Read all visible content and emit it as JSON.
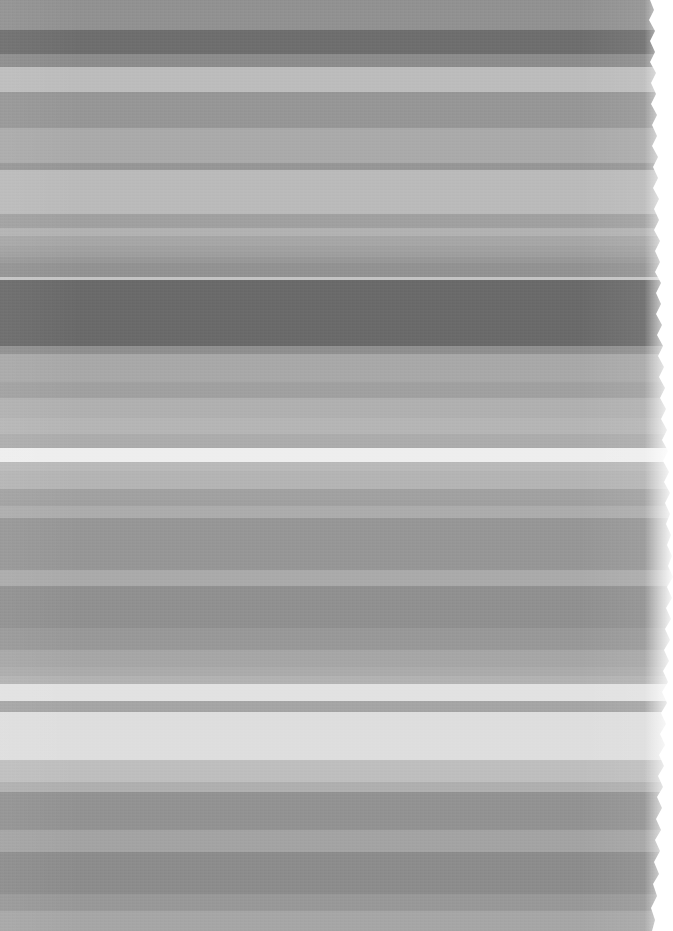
{
  "image": {
    "kind": "abstract-horizontal-band-scan",
    "title": "Horizontal grayscale band field",
    "width": 673,
    "height": 931,
    "background_color": "#ffffff",
    "description": "Low-resolution scan-like image composed of stacked horizontal grayscale bands with a ragged torn right edge exposing white paper."
  },
  "chart_data": {
    "type": "heatmap",
    "xlabel": "",
    "ylabel": "",
    "orientation": "horizontal-bands",
    "x": [
      0,
      673
    ],
    "legend_position": "none",
    "grid": false,
    "categories": [
      "b01",
      "b02",
      "b03",
      "b04",
      "b05",
      "b06",
      "b07",
      "b08",
      "b09",
      "b10",
      "b11",
      "b12",
      "b13",
      "b14",
      "b15",
      "b16",
      "b17",
      "b18",
      "b19",
      "b20",
      "b21",
      "b22",
      "b23",
      "b24",
      "b25",
      "b26",
      "b27",
      "b28",
      "b29",
      "b30",
      "b31",
      "b32",
      "b33",
      "b34",
      "b35",
      "b36",
      "b37",
      "b38",
      "b39",
      "b40",
      "b41",
      "b42",
      "b43",
      "b44",
      "b45",
      "b46"
    ],
    "values": [
      145,
      110,
      140,
      188,
      150,
      170,
      150,
      186,
      160,
      178,
      166,
      161,
      158,
      152,
      146,
      196,
      106,
      143,
      168,
      160,
      176,
      181,
      172,
      238,
      185,
      180,
      161,
      160,
      172,
      150,
      170,
      144,
      152,
      166,
      171,
      178,
      226,
      165,
      222,
      190,
      175,
      146,
      163,
      140,
      152,
      166
    ],
    "bands": [
      {
        "name": "b01",
        "y": 0,
        "h": 30,
        "color": "#919191",
        "gray": 145
      },
      {
        "name": "b02",
        "y": 30,
        "h": 24,
        "color": "#6e6e6e",
        "gray": 110
      },
      {
        "name": "b03",
        "y": 54,
        "h": 13,
        "color": "#8c8c8c",
        "gray": 140
      },
      {
        "name": "b04",
        "y": 67,
        "h": 25,
        "color": "#bcbcbc",
        "gray": 188
      },
      {
        "name": "b05",
        "y": 92,
        "h": 36,
        "color": "#969696",
        "gray": 150
      },
      {
        "name": "b06",
        "y": 128,
        "h": 35,
        "color": "#aaaaaa",
        "gray": 170
      },
      {
        "name": "b07",
        "y": 163,
        "h": 7,
        "color": "#969696",
        "gray": 150
      },
      {
        "name": "b08",
        "y": 170,
        "h": 44,
        "color": "#bababa",
        "gray": 186
      },
      {
        "name": "b09",
        "y": 214,
        "h": 14,
        "color": "#a0a0a0",
        "gray": 160
      },
      {
        "name": "b10",
        "y": 228,
        "h": 8,
        "color": "#b2b2b2",
        "gray": 178
      },
      {
        "name": "b11",
        "y": 236,
        "h": 10,
        "color": "#a6a6a6",
        "gray": 166
      },
      {
        "name": "b12",
        "y": 246,
        "h": 6,
        "color": "#a1a1a1",
        "gray": 161
      },
      {
        "name": "b13",
        "y": 252,
        "h": 5,
        "color": "#9e9e9e",
        "gray": 158
      },
      {
        "name": "b14",
        "y": 257,
        "h": 6,
        "color": "#989898",
        "gray": 152
      },
      {
        "name": "b15",
        "y": 263,
        "h": 14,
        "color": "#929292",
        "gray": 146
      },
      {
        "name": "b16",
        "y": 277,
        "h": 3,
        "color": "#c4c4c4",
        "gray": 196
      },
      {
        "name": "b17",
        "y": 280,
        "h": 66,
        "color": "#6a6a6a",
        "gray": 106
      },
      {
        "name": "b18",
        "y": 346,
        "h": 8,
        "color": "#8f8f8f",
        "gray": 143
      },
      {
        "name": "b19",
        "y": 354,
        "h": 28,
        "color": "#a8a8a8",
        "gray": 168
      },
      {
        "name": "b20",
        "y": 382,
        "h": 16,
        "color": "#a0a0a0",
        "gray": 160
      },
      {
        "name": "b21",
        "y": 398,
        "h": 20,
        "color": "#b0b0b0",
        "gray": 176
      },
      {
        "name": "b22",
        "y": 418,
        "h": 16,
        "color": "#b5b5b5",
        "gray": 181
      },
      {
        "name": "b23",
        "y": 434,
        "h": 14,
        "color": "#acacac",
        "gray": 172
      },
      {
        "name": "b24",
        "y": 448,
        "h": 14,
        "color": "#eeeeee",
        "gray": 238
      },
      {
        "name": "b25",
        "y": 462,
        "h": 9,
        "color": "#b9b9b9",
        "gray": 185
      },
      {
        "name": "b26",
        "y": 471,
        "h": 18,
        "color": "#b4b4b4",
        "gray": 180
      },
      {
        "name": "b27",
        "y": 489,
        "h": 11,
        "color": "#a1a1a1",
        "gray": 161
      },
      {
        "name": "b28",
        "y": 500,
        "h": 6,
        "color": "#a0a0a0",
        "gray": 160
      },
      {
        "name": "b29",
        "y": 506,
        "h": 12,
        "color": "#acacac",
        "gray": 172
      },
      {
        "name": "b30",
        "y": 518,
        "h": 52,
        "color": "#969696",
        "gray": 150
      },
      {
        "name": "b31",
        "y": 570,
        "h": 16,
        "color": "#aaaaaa",
        "gray": 170
      },
      {
        "name": "b32",
        "y": 586,
        "h": 42,
        "color": "#909090",
        "gray": 144
      },
      {
        "name": "b33",
        "y": 628,
        "h": 22,
        "color": "#989898",
        "gray": 152
      },
      {
        "name": "b34",
        "y": 650,
        "h": 17,
        "color": "#a6a6a6",
        "gray": 166
      },
      {
        "name": "b35",
        "y": 667,
        "h": 9,
        "color": "#ababab",
        "gray": 171
      },
      {
        "name": "b36",
        "y": 676,
        "h": 8,
        "color": "#b2b2b2",
        "gray": 178
      },
      {
        "name": "b37",
        "y": 684,
        "h": 17,
        "color": "#e2e2e2",
        "gray": 226
      },
      {
        "name": "b38",
        "y": 701,
        "h": 11,
        "color": "#a5a5a5",
        "gray": 165
      },
      {
        "name": "b39",
        "y": 712,
        "h": 48,
        "color": "#dedede",
        "gray": 222
      },
      {
        "name": "b40",
        "y": 760,
        "h": 22,
        "color": "#bebebe",
        "gray": 190
      },
      {
        "name": "b41",
        "y": 782,
        "h": 10,
        "color": "#afafaf",
        "gray": 175
      },
      {
        "name": "b42",
        "y": 792,
        "h": 38,
        "color": "#929292",
        "gray": 146
      },
      {
        "name": "b43",
        "y": 830,
        "h": 22,
        "color": "#a3a3a3",
        "gray": 163
      },
      {
        "name": "b44",
        "y": 852,
        "h": 42,
        "color": "#8c8c8c",
        "gray": 140
      },
      {
        "name": "b45",
        "y": 894,
        "h": 17,
        "color": "#989898",
        "gray": 152
      },
      {
        "name": "b46",
        "y": 911,
        "h": 20,
        "color": "#a6a6a6",
        "gray": 166
      }
    ],
    "torn_edge": {
      "side": "right",
      "paper_color": "#ffffff",
      "approx_x_range": [
        648,
        673
      ]
    }
  }
}
